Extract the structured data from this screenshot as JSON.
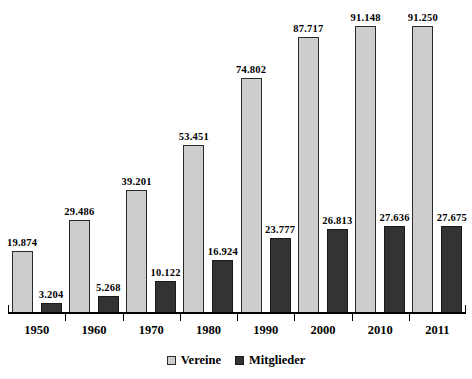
{
  "chart_data": {
    "type": "bar",
    "title": "",
    "subtitle": "",
    "xlabel": "",
    "ylabel": "",
    "categories": [
      "1950",
      "1960",
      "1970",
      "1980",
      "1990",
      "2000",
      "2010",
      "2011"
    ],
    "series": [
      {
        "name": "Vereine",
        "color": "#cdcdcd",
        "values": [
          19874,
          29486,
          39201,
          53451,
          74802,
          87717,
          91148,
          91250
        ],
        "labels": [
          "19.874",
          "29.486",
          "39.201",
          "53.451",
          "74.802",
          "87.717",
          "91.148",
          "91.250"
        ]
      },
      {
        "name": "Mitglieder",
        "color": "#333333",
        "values": [
          3204,
          5268,
          10122,
          16924,
          23777,
          26813,
          27636,
          27675
        ],
        "labels": [
          "3.204",
          "5.268",
          "10.122",
          "16.924",
          "23.777",
          "26.813",
          "27.636",
          "27.675"
        ]
      }
    ],
    "ylim": [
      0,
      100000
    ],
    "grid": false,
    "legend_position": "bottom",
    "axis": {
      "show_y_axis": false,
      "show_x_axis": true,
      "tick_labels": [
        "1950",
        "1960",
        "1970",
        "1980",
        "1990",
        "2000",
        "2010",
        "2011"
      ]
    }
  },
  "legend": {
    "items": [
      {
        "label": "Vereine",
        "color": "#cdcdcd"
      },
      {
        "label": "Mitglieder",
        "color": "#333333"
      }
    ]
  },
  "colors": {
    "vereine": "#cdcdcd",
    "mitglieder": "#333333",
    "axis": "#000000",
    "text": "#000000",
    "background": "#ffffff"
  }
}
